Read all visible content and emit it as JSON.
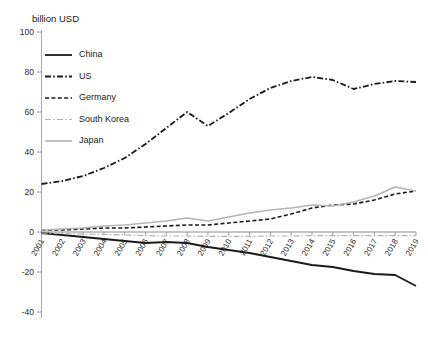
{
  "chart_data": {
    "type": "line",
    "title": "",
    "subtitle": "",
    "unit_label": "billion USD",
    "xlabel": "",
    "ylabel": "billion USD",
    "ylim": [
      -40,
      100
    ],
    "y_ticks": [
      100,
      80,
      60,
      40,
      20,
      0,
      -20,
      -40
    ],
    "grid": false,
    "zero_line": true,
    "legend_position": "top-left",
    "x": [
      "2001",
      "2002",
      "2003",
      "2004",
      "2005",
      "2006",
      "2007",
      "2008",
      "2009",
      "2010",
      "2011",
      "2012",
      "2013",
      "2014",
      "2015",
      "2016",
      "2017",
      "2018",
      "2019"
    ],
    "categories": [
      "2001",
      "2002",
      "2003",
      "2004",
      "2005",
      "2006",
      "2007",
      "2008",
      "2009",
      "2010",
      "2011",
      "2012",
      "2013",
      "2014",
      "2015",
      "2016",
      "2017",
      "2018",
      "2019"
    ],
    "series": [
      {
        "name": "China",
        "color": "#1a1a1a",
        "style": "solid",
        "width": 1.8,
        "values": [
          -0.5,
          -1.5,
          -2.5,
          -3.5,
          -4.5,
          -5.5,
          -5.0,
          -5.5,
          -7.5,
          -9.0,
          -10.5,
          -12.5,
          -14.5,
          -16.5,
          -17.5,
          -19.5,
          -21.0,
          -21.5,
          -27.0
        ]
      },
      {
        "name": "US",
        "color": "#1a1a1a",
        "style": "dashdot",
        "width": 1.8,
        "values": [
          24.0,
          25.5,
          28.0,
          32.0,
          37.0,
          44.0,
          52.0,
          60.0,
          53.0,
          59.5,
          66.5,
          72.0,
          75.5,
          77.5,
          76.0,
          71.5,
          74.0,
          75.5,
          75.0
        ]
      },
      {
        "name": "Germany",
        "color": "#1a1a1a",
        "style": "dashed",
        "width": 1.6,
        "values": [
          1.0,
          1.0,
          1.5,
          2.0,
          2.0,
          2.5,
          3.0,
          3.5,
          3.5,
          4.5,
          5.5,
          6.5,
          9.0,
          12.0,
          13.5,
          14.0,
          16.0,
          19.0,
          20.5
        ]
      },
      {
        "name": "South Korea",
        "color": "#b0b0b0",
        "style": "dashdot",
        "width": 1.2,
        "values": [
          -0.5,
          -0.8,
          -1.0,
          -1.2,
          -1.5,
          -1.8,
          -2.0,
          -2.0,
          -2.2,
          -2.2,
          -2.2,
          -2.0,
          -2.0,
          -1.8,
          -1.8,
          -1.8,
          -1.8,
          -1.8,
          -1.8
        ]
      },
      {
        "name": "Japan",
        "color": "#b5b5b5",
        "style": "solid",
        "width": 1.6,
        "values": [
          1.0,
          1.5,
          2.0,
          3.0,
          3.5,
          4.5,
          5.5,
          7.0,
          5.5,
          7.5,
          9.5,
          11.0,
          12.0,
          13.5,
          13.0,
          15.0,
          18.0,
          22.5,
          20.5
        ]
      }
    ],
    "legend": [
      {
        "label": "China"
      },
      {
        "label": "US"
      },
      {
        "label": "Germany"
      },
      {
        "label": "South Korea"
      },
      {
        "label": "Japan"
      }
    ]
  }
}
